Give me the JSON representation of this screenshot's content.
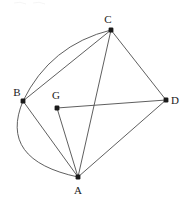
{
  "figure": {
    "background_color": "#ffffff",
    "stroke_color": "#4d4d4d",
    "vertex_color": "#1a1a1a",
    "width": 183,
    "height": 204,
    "vertices": [
      {
        "id": "A",
        "label": "A",
        "x": 78,
        "y": 177,
        "label_x": 78,
        "label_y": 194
      },
      {
        "id": "B",
        "label": "B",
        "x": 23,
        "y": 101,
        "label_x": 17,
        "label_y": 96
      },
      {
        "id": "C",
        "label": "C",
        "x": 111,
        "y": 30,
        "label_x": 108,
        "label_y": 23
      },
      {
        "id": "D",
        "label": "D",
        "x": 166,
        "y": 100,
        "label_x": 175,
        "label_y": 104
      },
      {
        "id": "G",
        "label": "G",
        "x": 57,
        "y": 108,
        "label_x": 56,
        "label_y": 99
      }
    ],
    "segments": [
      {
        "name": "segment-BC",
        "from": "B",
        "to": "C"
      },
      {
        "name": "segment-CD",
        "from": "C",
        "to": "D"
      },
      {
        "name": "segment-CA",
        "from": "C",
        "to": "A"
      },
      {
        "name": "segment-AD",
        "from": "A",
        "to": "D"
      },
      {
        "name": "segment-AB",
        "from": "A",
        "to": "B"
      },
      {
        "name": "segment-AG",
        "from": "A",
        "to": "G"
      },
      {
        "name": "segment-GD",
        "from": "G",
        "to": "D"
      }
    ],
    "arcs": [
      {
        "name": "arc-BC",
        "from": "B",
        "to": "C",
        "bulge": "upper-left"
      },
      {
        "name": "arc-BA",
        "from": "B",
        "to": "A",
        "bulge": "lower-left"
      }
    ]
  }
}
